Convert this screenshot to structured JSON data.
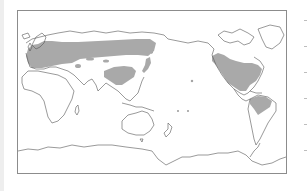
{
  "figure": {
    "type": "world-map",
    "projection": "equirectangular, Pacific-centered",
    "title": "",
    "colors": {
      "background": "#ffffff",
      "frame": "#8c8c8c",
      "coastline": "#555555",
      "shaded_region": "#a9a9a9",
      "left_strip": "#eeeeee",
      "ticks": "#bdbdbd"
    },
    "shaded_regions": [
      {
        "name": "Europe",
        "description": "Western and central Europe shaded"
      },
      {
        "name": "Northern Eurasia band",
        "description": "Broad band across Russia/Siberia from Europe to the Far East"
      },
      {
        "name": "Central Asia patches",
        "description": "Small scattered patches in Central Asia"
      },
      {
        "name": "East China",
        "description": "Eastern China shaded"
      },
      {
        "name": "Japan",
        "description": "Japan shaded"
      },
      {
        "name": "North America",
        "description": "Western US coast strip, eastern/central USA and southern Canada"
      },
      {
        "name": "Northern South America",
        "description": "Northern Brazil / Amazon region"
      }
    ],
    "right_ticks": [
      0,
      26,
      52,
      78,
      104,
      130
    ]
  }
}
